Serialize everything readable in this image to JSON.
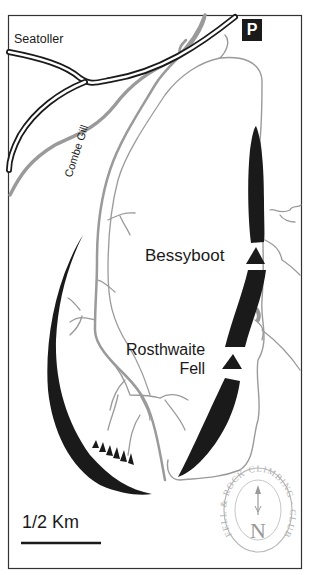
{
  "map": {
    "title": "Combe Gill / Bessyboot / Rosthwaite Fell",
    "labels": {
      "village": "Seatoller",
      "stream": "Combe Gill",
      "peak1": "Bessyboot",
      "peak2_line1": "Rosthwaite",
      "peak2_line2": "Fell"
    },
    "parking_icon": "P",
    "scale_bar": {
      "label": "1/2 Km"
    },
    "logo": {
      "text": "FELL & ROCK CLIMBING · CLUB ·",
      "north_letter": "N"
    },
    "colors": {
      "crag": "#1a1a1a",
      "road": "#1a1a1a",
      "stream": "#9a9a9a",
      "border": "#333333",
      "logo": "#b8b8b8"
    }
  }
}
